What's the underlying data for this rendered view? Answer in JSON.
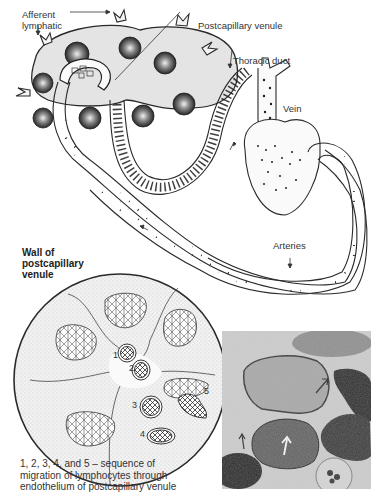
{
  "figure": {
    "top_diagram": {
      "labels": {
        "afferent_lymphatic_1": "Afferent",
        "afferent_lymphatic_2": "lymphatic",
        "postcapillary_venule": "Postcapillary venule",
        "thoracic_duct": "Thoracic duct",
        "vein": "Vein",
        "arteries": "Arteries"
      }
    },
    "cross_section": {
      "heading_line1": "Wall of",
      "heading_line2": "postcapillary",
      "heading_line3": "venule",
      "step_numbers": [
        "1",
        "2",
        "3",
        "4",
        "5"
      ]
    },
    "micrograph": {
      "description": "electron micrograph of lymphocytes migrating through endothelium"
    },
    "caption": {
      "line1": "1, 2, 3, 4, and 5 – sequence of",
      "line2": "migration of lymphocytes through",
      "line3": "endothelium of postcapillary venule"
    }
  },
  "colors": {
    "line": "#2a2a2a",
    "node_fill": "#e6e6e6",
    "follicle": "#3a3a3a",
    "stipple": "#cfcfcf"
  }
}
